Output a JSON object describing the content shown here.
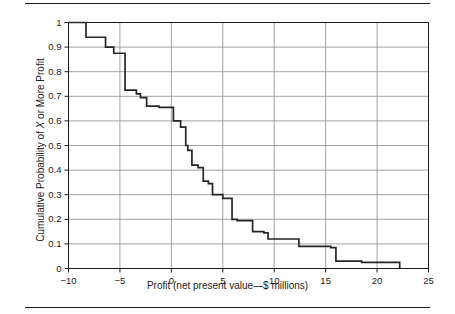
{
  "figure": {
    "has_top_rule": true,
    "has_bottom_rule": true,
    "rule_color": "#1a1a1a"
  },
  "axes": {
    "xlabel_prefix": "Profit (net present value—$ millions)",
    "ylabel_part1": "Cumulative Probability of ",
    "ylabel_italic": "X",
    "ylabel_part2": " or More Profit",
    "xticks": [
      "-10",
      "-5",
      "0",
      "5",
      "10",
      "15",
      "20",
      "25"
    ],
    "xtick_values": [
      -10,
      -5,
      0,
      5,
      10,
      15,
      20,
      25
    ],
    "yticks": [
      "0",
      "0.1",
      "0.2",
      "0.3",
      "0.4",
      "0.5",
      "0.6",
      "0.7",
      "0.8",
      "0.9",
      "1"
    ],
    "ytick_values": [
      0,
      0.1,
      0.2,
      0.3,
      0.4,
      0.5,
      0.6,
      0.7,
      0.8,
      0.9,
      1.0
    ],
    "grid_color": "#8c8c8c",
    "frame_color": "#1a1a1a",
    "line_color": "#262626"
  },
  "chart_data": {
    "type": "line",
    "subtype": "step-decreasing-cumulative",
    "title": "",
    "xlabel": "Profit (net present value—$ millions)",
    "ylabel": "Cumulative Probability of X or More Profit",
    "xlim": [
      -10,
      25
    ],
    "ylim": [
      0,
      1
    ],
    "xticks": [
      -10,
      -5,
      0,
      5,
      10,
      15,
      20,
      25
    ],
    "yticks": [
      0,
      0.1,
      0.2,
      0.3,
      0.4,
      0.5,
      0.6,
      0.7,
      0.8,
      0.9,
      1.0
    ],
    "grid": true,
    "legend": null,
    "series": [
      {
        "name": "Cumulative probability of X or more profit",
        "x": [
          -10.0,
          -8.3,
          -8.3,
          -6.4,
          -6.4,
          -5.6,
          -5.6,
          -4.5,
          -4.5,
          -3.4,
          -3.4,
          -3.0,
          -3.0,
          -2.4,
          -2.4,
          -1.2,
          -1.2,
          0.2,
          0.2,
          0.9,
          0.9,
          1.4,
          1.4,
          1.6,
          1.6,
          2.0,
          2.0,
          2.6,
          2.6,
          3.1,
          3.1,
          3.6,
          3.6,
          4.0,
          4.0,
          5.0,
          5.0,
          5.9,
          5.9,
          6.4,
          6.4,
          7.9,
          7.9,
          9.0,
          9.0,
          9.4,
          9.4,
          12.4,
          12.4,
          15.5,
          15.5,
          16.0,
          16.0,
          18.5,
          18.5,
          22.2,
          22.2
        ],
        "y": [
          1.0,
          1.0,
          0.94,
          0.94,
          0.9,
          0.9,
          0.875,
          0.875,
          0.725,
          0.725,
          0.71,
          0.71,
          0.695,
          0.695,
          0.66,
          0.66,
          0.655,
          0.655,
          0.6,
          0.6,
          0.575,
          0.575,
          0.5,
          0.5,
          0.48,
          0.48,
          0.42,
          0.42,
          0.41,
          0.41,
          0.355,
          0.355,
          0.345,
          0.345,
          0.3,
          0.3,
          0.285,
          0.285,
          0.2,
          0.2,
          0.195,
          0.195,
          0.15,
          0.15,
          0.145,
          0.145,
          0.12,
          0.12,
          0.09,
          0.09,
          0.085,
          0.085,
          0.03,
          0.03,
          0.025,
          0.025,
          0.0
        ],
        "steps": [
          {
            "x": -10.0,
            "y": 1.0
          },
          {
            "x": -8.3,
            "y": 0.94
          },
          {
            "x": -6.4,
            "y": 0.9
          },
          {
            "x": -5.6,
            "y": 0.875
          },
          {
            "x": -4.5,
            "y": 0.725
          },
          {
            "x": -3.4,
            "y": 0.71
          },
          {
            "x": -3.0,
            "y": 0.695
          },
          {
            "x": -2.4,
            "y": 0.66
          },
          {
            "x": -1.2,
            "y": 0.655
          },
          {
            "x": 0.2,
            "y": 0.6
          },
          {
            "x": 0.9,
            "y": 0.575
          },
          {
            "x": 1.4,
            "y": 0.5
          },
          {
            "x": 1.6,
            "y": 0.48
          },
          {
            "x": 2.0,
            "y": 0.42
          },
          {
            "x": 2.6,
            "y": 0.41
          },
          {
            "x": 3.1,
            "y": 0.355
          },
          {
            "x": 3.6,
            "y": 0.345
          },
          {
            "x": 4.0,
            "y": 0.3
          },
          {
            "x": 5.0,
            "y": 0.285
          },
          {
            "x": 5.9,
            "y": 0.2
          },
          {
            "x": 6.4,
            "y": 0.195
          },
          {
            "x": 7.9,
            "y": 0.15
          },
          {
            "x": 9.0,
            "y": 0.145
          },
          {
            "x": 9.4,
            "y": 0.12
          },
          {
            "x": 12.4,
            "y": 0.09
          },
          {
            "x": 15.5,
            "y": 0.085
          },
          {
            "x": 16.0,
            "y": 0.03
          },
          {
            "x": 18.5,
            "y": 0.025
          },
          {
            "x": 22.2,
            "y": 0.0
          }
        ]
      }
    ]
  }
}
